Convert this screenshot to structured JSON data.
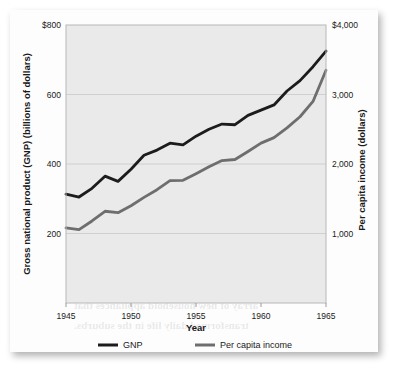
{
  "figure": {
    "background_color": "#fdfdfd",
    "plot_background_color": "#eaeaea",
    "bleed_through_lines": [
      "Constitution, and the Election of 1952.",
      "Eisenhower, and the Election of 1952.",
      "The American economy expanded at a",
      "rate never before seen in the nation's",
      "history. The gross national product rose",
      "steadily through the 1950s, and by 1960",
      "it had reached a level far above that of",
      "any other nation in the world.",
      "Personal income rose in step with the",
      "national totals, and per capita income",
      "nearly doubled during the period.",
      "Consumer spending surged as families",
      "bought homes, automobiles, and a wide",
      "array of new household appliances that",
      "transformed daily life in the suburbs."
    ]
  },
  "chart_data": {
    "type": "line",
    "title": "",
    "xlabel": "Year",
    "ylabel": "Gross national product (GNP) (billions of dollars)",
    "y2label": "Per capita income (dollars)",
    "grid": true,
    "legend_position": "bottom",
    "xlim": [
      1945,
      1965
    ],
    "ylim": [
      0,
      800
    ],
    "y2lim": [
      0,
      4000
    ],
    "xticks": [
      1945,
      1950,
      1955,
      1960,
      1965
    ],
    "xticklabels": [
      "1945",
      "1950",
      "1955",
      "1960",
      "1965"
    ],
    "yticks": [
      200,
      400,
      600,
      800
    ],
    "yticklabels": [
      "200",
      "400",
      "600",
      "$800"
    ],
    "y2ticks": [
      1000,
      2000,
      3000,
      4000
    ],
    "y2ticklabels": [
      "1,000",
      "2,000",
      "3,000",
      "$4,000"
    ],
    "x": [
      1945,
      1946,
      1947,
      1948,
      1949,
      1950,
      1951,
      1952,
      1953,
      1954,
      1955,
      1956,
      1957,
      1958,
      1959,
      1960,
      1961,
      1962,
      1963,
      1964,
      1965
    ],
    "series": [
      {
        "name": "GNP",
        "color": "#1c1c1c",
        "width": 2.8,
        "axis": "left",
        "values": [
          313,
          305,
          330,
          365,
          350,
          385,
          425,
          440,
          460,
          455,
          480,
          500,
          515,
          513,
          540,
          555,
          570,
          610,
          640,
          680,
          725
        ]
      },
      {
        "name": "Per capita income",
        "color": "#6e6e6e",
        "width": 2.8,
        "axis": "right",
        "values": [
          1080,
          1055,
          1180,
          1320,
          1300,
          1400,
          1520,
          1630,
          1760,
          1765,
          1860,
          1960,
          2050,
          2065,
          2180,
          2300,
          2380,
          2520,
          2680,
          2900,
          3350
        ]
      }
    ],
    "legend": [
      {
        "label": "GNP",
        "color": "#1c1c1c"
      },
      {
        "label": "Per capita income",
        "color": "#6e6e6e"
      }
    ]
  }
}
